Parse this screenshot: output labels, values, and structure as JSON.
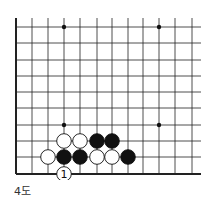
{
  "diagram": {
    "caption": "4도",
    "grid": {
      "x_lines": [
        16,
        32,
        48,
        64,
        80,
        97,
        112,
        128,
        143,
        159,
        175,
        192
      ],
      "y_lines": [
        27,
        43,
        60,
        76,
        92,
        108,
        125,
        141,
        157,
        174
      ],
      "right_extent": 201,
      "top_extent": 18,
      "left_edge": true,
      "bottom_edge": true
    },
    "star_points": [
      [
        3,
        0
      ],
      [
        9,
        0
      ],
      [
        3,
        6
      ],
      [
        9,
        6
      ]
    ],
    "stones": [
      {
        "col": 3,
        "row": 7,
        "color": "white"
      },
      {
        "col": 4,
        "row": 7,
        "color": "white"
      },
      {
        "col": 5,
        "row": 7,
        "color": "black"
      },
      {
        "col": 6,
        "row": 7,
        "color": "black"
      },
      {
        "col": 2,
        "row": 8,
        "color": "white"
      },
      {
        "col": 3,
        "row": 8,
        "color": "black"
      },
      {
        "col": 4,
        "row": 8,
        "color": "black"
      },
      {
        "col": 5,
        "row": 8,
        "color": "white"
      },
      {
        "col": 6,
        "row": 8,
        "color": "white"
      },
      {
        "col": 7,
        "row": 8,
        "color": "black"
      },
      {
        "col": 3,
        "row": 9,
        "color": "white",
        "label": "1"
      }
    ]
  }
}
